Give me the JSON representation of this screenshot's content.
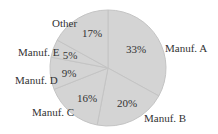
{
  "chart_data": {
    "type": "pie",
    "title": "",
    "categories": [
      "Manuf. A",
      "Manuf. B",
      "Manuf. C",
      "Manuf. D",
      "Manuf. E",
      "Other"
    ],
    "values": [
      33,
      20,
      16,
      9,
      5,
      17
    ],
    "value_labels": [
      "33%",
      "20%",
      "16%",
      "9%",
      "5%",
      "17%"
    ],
    "start_angle": "12 o'clock",
    "direction": "clockwise",
    "slice_color": "#d4d4d4",
    "edge_color": "#c4c4c4",
    "legend": "none (labels outside slices)"
  }
}
